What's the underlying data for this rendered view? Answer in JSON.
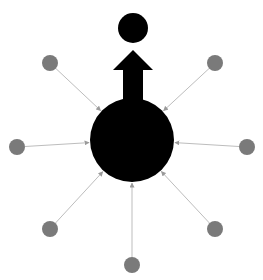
{
  "diagram": {
    "width": 263,
    "height": 280,
    "colors": {
      "background": "#ffffff",
      "hub": "#000000",
      "target": "#000000",
      "arrow": "#000000",
      "satellite": "#7a7a7a",
      "edge": "#bdbdbd"
    },
    "hub": {
      "cx": 132,
      "cy": 140,
      "r": 42
    },
    "target": {
      "cx": 133,
      "cy": 28,
      "r": 15
    },
    "up_arrow": {
      "shaft_x": 123,
      "shaft_w": 20,
      "head_left": 113,
      "head_right": 153,
      "tip_y": 50,
      "head_base_y": 70,
      "bottom_y": 100
    },
    "satellites": [
      {
        "name": "top-left",
        "cx": 50,
        "cy": 63,
        "r": 8
      },
      {
        "name": "top-right",
        "cx": 215,
        "cy": 63,
        "r": 8
      },
      {
        "name": "left",
        "cx": 17,
        "cy": 147,
        "r": 8
      },
      {
        "name": "right",
        "cx": 247,
        "cy": 147,
        "r": 8
      },
      {
        "name": "bottom-left",
        "cx": 50,
        "cy": 229,
        "r": 8
      },
      {
        "name": "bottom-right",
        "cx": 215,
        "cy": 229,
        "r": 8
      },
      {
        "name": "bottom",
        "cx": 132,
        "cy": 265,
        "r": 8
      }
    ]
  }
}
